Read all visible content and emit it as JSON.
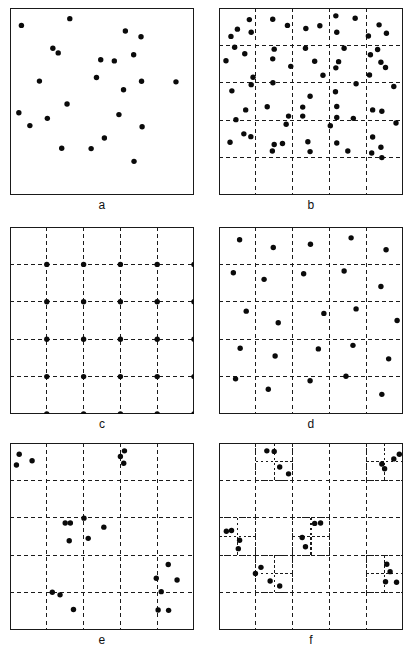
{
  "figure": {
    "background_color": "#ffffff",
    "frame_color": "#1a1a1a",
    "point_color": "#0a0a0a",
    "grid_color": "#1b1b1b",
    "point_radius": 2.7,
    "panel_width": 184,
    "panel_height": 187,
    "columns": 2,
    "rows": 3
  },
  "panels": [
    {
      "id": "a",
      "label": "a",
      "x": 10,
      "y": 8,
      "grid": {
        "type": "none",
        "divisions": 0
      },
      "subgrid": [],
      "points": [
        [
          0.325,
          0.057
        ],
        [
          0.062,
          0.093
        ],
        [
          0.627,
          0.123
        ],
        [
          0.712,
          0.154
        ],
        [
          0.233,
          0.215
        ],
        [
          0.262,
          0.24
        ],
        [
          0.672,
          0.25
        ],
        [
          0.493,
          0.277
        ],
        [
          0.567,
          0.283
        ],
        [
          0.47,
          0.372
        ],
        [
          0.16,
          0.391
        ],
        [
          0.715,
          0.392
        ],
        [
          0.902,
          0.395
        ],
        [
          0.617,
          0.437
        ],
        [
          0.31,
          0.513
        ],
        [
          0.048,
          0.56
        ],
        [
          0.592,
          0.57
        ],
        [
          0.203,
          0.59
        ],
        [
          0.108,
          0.629
        ],
        [
          0.718,
          0.635
        ],
        [
          0.513,
          0.695
        ],
        [
          0.281,
          0.75
        ],
        [
          0.441,
          0.752
        ],
        [
          0.674,
          0.82
        ]
      ]
    },
    {
      "id": "b",
      "label": "b",
      "x": 219,
      "y": 8,
      "grid": {
        "type": "uniform",
        "divisions": 5
      },
      "subgrid": [],
      "points": [
        [
          0.165,
          0.062
        ],
        [
          0.292,
          0.06
        ],
        [
          0.635,
          0.042
        ],
        [
          0.74,
          0.055
        ],
        [
          0.1,
          0.113
        ],
        [
          0.372,
          0.093
        ],
        [
          0.548,
          0.095
        ],
        [
          0.87,
          0.09
        ],
        [
          0.175,
          0.13
        ],
        [
          0.472,
          0.11
        ],
        [
          0.64,
          0.13
        ],
        [
          0.91,
          0.135
        ],
        [
          0.065,
          0.152
        ],
        [
          0.812,
          0.15
        ],
        [
          0.085,
          0.21
        ],
        [
          0.3,
          0.22
        ],
        [
          0.47,
          0.215
        ],
        [
          0.68,
          0.215
        ],
        [
          0.862,
          0.222
        ],
        [
          0.14,
          0.245
        ],
        [
          0.823,
          0.25
        ],
        [
          0.038,
          0.282
        ],
        [
          0.292,
          0.272
        ],
        [
          0.52,
          0.285
        ],
        [
          0.65,
          0.287
        ],
        [
          0.88,
          0.29
        ],
        [
          0.39,
          0.312
        ],
        [
          0.635,
          0.32
        ],
        [
          0.905,
          0.318
        ],
        [
          0.185,
          0.37
        ],
        [
          0.565,
          0.36
        ],
        [
          0.818,
          0.358
        ],
        [
          0.175,
          0.41
        ],
        [
          0.293,
          0.4
        ],
        [
          0.745,
          0.405
        ],
        [
          0.95,
          0.42
        ],
        [
          0.07,
          0.443
        ],
        [
          0.633,
          0.448
        ],
        [
          0.495,
          0.472
        ],
        [
          0.262,
          0.528
        ],
        [
          0.455,
          0.53
        ],
        [
          0.64,
          0.527
        ],
        [
          0.145,
          0.545
        ],
        [
          0.835,
          0.545
        ],
        [
          0.885,
          0.552
        ],
        [
          0.378,
          0.578
        ],
        [
          0.455,
          0.578
        ],
        [
          0.64,
          0.585
        ],
        [
          0.73,
          0.59
        ],
        [
          0.092,
          0.597
        ],
        [
          0.962,
          0.615
        ],
        [
          0.365,
          0.622
        ],
        [
          0.605,
          0.63
        ],
        [
          0.135,
          0.673
        ],
        [
          0.173,
          0.688
        ],
        [
          0.835,
          0.69
        ],
        [
          0.06,
          0.718
        ],
        [
          0.3,
          0.73
        ],
        [
          0.345,
          0.725
        ],
        [
          0.483,
          0.715
        ],
        [
          0.64,
          0.722
        ],
        [
          0.88,
          0.745
        ],
        [
          0.29,
          0.765
        ],
        [
          0.495,
          0.768
        ],
        [
          0.7,
          0.765
        ],
        [
          0.83,
          0.775
        ],
        [
          0.885,
          0.8
        ]
      ]
    },
    {
      "id": "c",
      "label": "c",
      "x": 10,
      "y": 227,
      "grid": {
        "type": "uniform",
        "divisions": 5
      },
      "subgrid": [],
      "lattice": true,
      "points": [
        [
          0.2,
          0.2
        ],
        [
          0.4,
          0.2
        ],
        [
          0.6,
          0.2
        ],
        [
          0.8,
          0.2
        ],
        [
          1.0,
          0.2
        ],
        [
          0.2,
          0.4
        ],
        [
          0.4,
          0.4
        ],
        [
          0.6,
          0.4
        ],
        [
          0.8,
          0.4
        ],
        [
          1.0,
          0.4
        ],
        [
          0.2,
          0.6
        ],
        [
          0.4,
          0.6
        ],
        [
          0.6,
          0.6
        ],
        [
          0.8,
          0.6
        ],
        [
          1.0,
          0.6
        ],
        [
          0.2,
          0.8
        ],
        [
          0.4,
          0.8
        ],
        [
          0.6,
          0.8
        ],
        [
          0.8,
          0.8
        ],
        [
          1.0,
          0.8
        ],
        [
          0.2,
          1.0
        ],
        [
          0.4,
          1.0
        ],
        [
          0.6,
          1.0
        ],
        [
          0.8,
          1.0
        ],
        [
          1.0,
          1.0
        ]
      ]
    },
    {
      "id": "d",
      "label": "d",
      "x": 219,
      "y": 227,
      "grid": {
        "type": "uniform",
        "divisions": 5
      },
      "subgrid": [],
      "points": [
        [
          0.112,
          0.068
        ],
        [
          0.295,
          0.11
        ],
        [
          0.497,
          0.092
        ],
        [
          0.718,
          0.058
        ],
        [
          0.908,
          0.122
        ],
        [
          0.078,
          0.245
        ],
        [
          0.245,
          0.28
        ],
        [
          0.46,
          0.25
        ],
        [
          0.68,
          0.235
        ],
        [
          0.88,
          0.318
        ],
        [
          0.148,
          0.45
        ],
        [
          0.322,
          0.512
        ],
        [
          0.57,
          0.462
        ],
        [
          0.745,
          0.438
        ],
        [
          0.968,
          0.5
        ],
        [
          0.115,
          0.648
        ],
        [
          0.305,
          0.69
        ],
        [
          0.54,
          0.652
        ],
        [
          0.728,
          0.633
        ],
        [
          0.922,
          0.705
        ],
        [
          0.09,
          0.812
        ],
        [
          0.268,
          0.868
        ],
        [
          0.495,
          0.822
        ],
        [
          0.69,
          0.798
        ],
        [
          0.885,
          0.895
        ]
      ]
    },
    {
      "id": "e",
      "label": "e",
      "x": 10,
      "y": 443,
      "grid": {
        "type": "uniform",
        "divisions": 5
      },
      "subgrid": [],
      "points": [
        [
          0.05,
          0.06
        ],
        [
          0.12,
          0.095
        ],
        [
          0.035,
          0.118
        ],
        [
          0.622,
          0.042
        ],
        [
          0.6,
          0.072
        ],
        [
          0.618,
          0.108
        ],
        [
          0.3,
          0.428
        ],
        [
          0.328,
          0.428
        ],
        [
          0.402,
          0.402
        ],
        [
          0.51,
          0.45
        ],
        [
          0.425,
          0.51
        ],
        [
          0.322,
          0.523
        ],
        [
          0.86,
          0.65
        ],
        [
          0.795,
          0.723
        ],
        [
          0.908,
          0.733
        ],
        [
          0.822,
          0.795
        ],
        [
          0.805,
          0.893
        ],
        [
          0.862,
          0.895
        ],
        [
          0.23,
          0.798
        ],
        [
          0.272,
          0.812
        ],
        [
          0.345,
          0.89
        ]
      ]
    },
    {
      "id": "f",
      "label": "f",
      "x": 219,
      "y": 443,
      "grid": {
        "type": "uniform",
        "divisions": 5
      },
      "subgrid": [
        {
          "x0": 0.2,
          "y0": 0.0,
          "x1": 0.4,
          "y1": 0.2,
          "divisions": 2
        },
        {
          "x0": 0.8,
          "y0": 0.0,
          "x1": 1.0,
          "y1": 0.2,
          "divisions": 2
        },
        {
          "x0": 0.0,
          "y0": 0.4,
          "x1": 0.2,
          "y1": 0.6,
          "divisions": 2
        },
        {
          "x0": 0.4,
          "y0": 0.4,
          "x1": 0.6,
          "y1": 0.6,
          "divisions": 2
        },
        {
          "x0": 0.2,
          "y0": 0.6,
          "x1": 0.4,
          "y1": 0.8,
          "divisions": 2
        },
        {
          "x0": 0.8,
          "y0": 0.6,
          "x1": 1.0,
          "y1": 0.8,
          "divisions": 2
        }
      ],
      "points": [
        [
          0.26,
          0.042
        ],
        [
          0.3,
          0.045
        ],
        [
          0.33,
          0.128
        ],
        [
          0.378,
          0.165
        ],
        [
          0.885,
          0.112
        ],
        [
          0.9,
          0.138
        ],
        [
          0.95,
          0.085
        ],
        [
          0.98,
          0.06
        ],
        [
          0.04,
          0.472
        ],
        [
          0.068,
          0.468
        ],
        [
          0.112,
          0.52
        ],
        [
          0.105,
          0.565
        ],
        [
          0.52,
          0.43
        ],
        [
          0.552,
          0.428
        ],
        [
          0.452,
          0.505
        ],
        [
          0.47,
          0.555
        ],
        [
          0.228,
          0.665
        ],
        [
          0.198,
          0.698
        ],
        [
          0.278,
          0.738
        ],
        [
          0.33,
          0.765
        ],
        [
          0.912,
          0.648
        ],
        [
          0.93,
          0.688
        ],
        [
          0.905,
          0.742
        ],
        [
          0.965,
          0.745
        ]
      ]
    }
  ]
}
